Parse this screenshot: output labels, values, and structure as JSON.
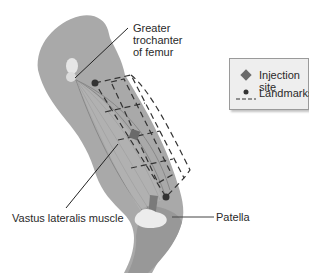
{
  "labels": {
    "greater_trochanter": [
      "Greater",
      "trochanter",
      "of femur"
    ],
    "vastus_lateralis": "Vastus lateralis muscle",
    "patella": "Patella"
  },
  "legend": {
    "items": [
      {
        "icon": "diamond-icon",
        "label": "Injection site"
      },
      {
        "icon": "dot-dashed-line-icon",
        "label": "Landmarks"
      }
    ]
  },
  "colors": {
    "leg": "#a9a9a9",
    "leg_dark": "#8f8f8f",
    "bone": "#ececec",
    "muscle_lines": "#7a7a7a",
    "marker": "#6a6a6a",
    "landmark_dot": "#333333",
    "legend_bg": "#eeeeee",
    "text": "#2a2a2a"
  }
}
